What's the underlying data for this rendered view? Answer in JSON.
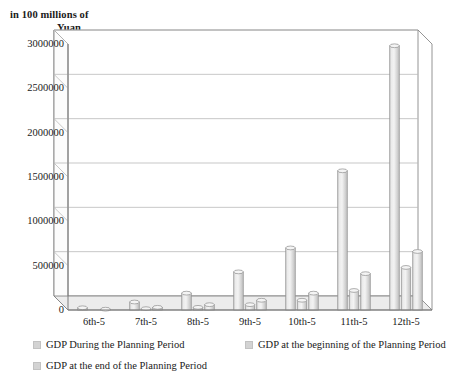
{
  "axis_title": {
    "line1": "in 100 millions of",
    "line2": "Yuan"
  },
  "legend": {
    "items": [
      {
        "label": "GDP During the Planning Period",
        "color": "#d6d6d6",
        "icon": "legend-swatch-icon"
      },
      {
        "label": "GDP at the beginning of the Planning Period",
        "color": "#d6d6d6",
        "icon": "legend-swatch-icon"
      },
      {
        "label": "GDP at the end of the Planning Period",
        "color": "#d6d6d6",
        "icon": "legend-swatch-icon"
      }
    ]
  },
  "chart_data": {
    "type": "bar",
    "title": "",
    "subtitle": "",
    "xlabel": "",
    "ylabel": "in 100 millions of Yuan",
    "ylim": [
      0,
      3000000
    ],
    "ytick_values": [
      0,
      500000,
      1000000,
      1500000,
      2000000,
      2500000,
      3000000
    ],
    "ytick_labels": [
      "0",
      "500000",
      "1000000",
      "1500000",
      "2000000",
      "2500000",
      "3000000"
    ],
    "grid": true,
    "grid_axis": "y",
    "legend_position": "bottom",
    "style": "3d-column",
    "categories": [
      "6th-5",
      "7th-5",
      "8th-5",
      "9th-5",
      "10th-5",
      "11th-5",
      "12th-5"
    ],
    "series": [
      {
        "name": "GDP During the Planning Period",
        "color": "#d8d8d8",
        "values": [
          25000,
          90000,
          190000,
          430000,
          700000,
          1570000,
          2980000
        ]
      },
      {
        "name": "GDP at the beginning of the Planning Period",
        "color": "#d8d8d8",
        "values": [
          4000,
          15000,
          30000,
          60000,
          110000,
          220000,
          480000
        ]
      },
      {
        "name": "GDP at the end of the Planning Period",
        "color": "#d8d8d8",
        "values": [
          9000,
          30000,
          60000,
          110000,
          190000,
          410000,
          660000
        ]
      }
    ]
  },
  "colors": {
    "bar_face_light": "#eaeaea",
    "bar_face_mid": "#d4d4d4",
    "bar_face_dark": "#c0c0c0",
    "bar_outline": "#8f8f8f",
    "grid": "#b9b9b9",
    "axis": "#7a7a7a",
    "floor": "#ececec",
    "text": "#1a1a1a"
  }
}
